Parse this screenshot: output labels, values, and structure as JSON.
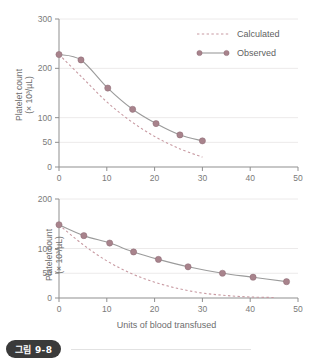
{
  "figure": {
    "caption_label": "그림 9-8",
    "xlabel": "Units of blood transfused",
    "ylabel_line1": "Platelet count",
    "ylabel_line2": "(× 10³/µL)"
  },
  "legend": {
    "calculated_label": "Calculated",
    "observed_label": "Observed",
    "calculated_color": "#c89aa2",
    "observed_color": "#9b9b9b",
    "marker_color": "#a8838c",
    "position": "top-right"
  },
  "chart_data": [
    {
      "id": "top",
      "type": "line",
      "title": "",
      "xlabel": "",
      "ylabel": "Platelet count (× 10³/µL)",
      "xlim": [
        0,
        50
      ],
      "ylim": [
        0,
        300
      ],
      "xticks": [
        0,
        10,
        20,
        30,
        40,
        50
      ],
      "yticks": [
        0,
        50,
        100,
        200,
        300
      ],
      "grid": "horizontal-faint",
      "legend": [
        "Calculated",
        "Observed"
      ],
      "series": [
        {
          "name": "Observed",
          "style": "solid-with-markers",
          "x": [
            0,
            4.6,
            10.2,
            15.4,
            20.3,
            25.3,
            30.0
          ],
          "values": [
            228,
            217,
            160,
            117,
            88,
            65,
            53
          ]
        },
        {
          "name": "Calculated",
          "style": "dashed",
          "x": [
            0,
            5,
            10,
            15,
            20,
            25,
            30
          ],
          "values": [
            228,
            180,
            132,
            93,
            62,
            38,
            20
          ]
        }
      ]
    },
    {
      "id": "bottom",
      "type": "line",
      "title": "",
      "xlabel": "Units of blood transfused",
      "ylabel": "Platelet count (× 10³/µL)",
      "xlim": [
        0,
        50
      ],
      "ylim": [
        0,
        200
      ],
      "xticks": [
        0,
        10,
        20,
        30,
        40,
        50
      ],
      "yticks": [
        0,
        50,
        100,
        200
      ],
      "grid": "horizontal-faint",
      "legend": [
        "Calculated",
        "Observed"
      ],
      "series": [
        {
          "name": "Observed",
          "style": "solid-with-markers",
          "x": [
            0,
            5.2,
            10.6,
            15.6,
            20.8,
            27.0,
            34.2,
            40.6,
            47.6
          ],
          "values": [
            148,
            126,
            111,
            93,
            78,
            63,
            50,
            42,
            33
          ]
        },
        {
          "name": "Calculated",
          "style": "dashed",
          "x": [
            0,
            5,
            10,
            15,
            20,
            25,
            30,
            35,
            40,
            45
          ],
          "values": [
            148,
            108,
            75,
            50,
            32,
            19,
            10,
            5,
            2,
            1
          ]
        }
      ]
    }
  ]
}
